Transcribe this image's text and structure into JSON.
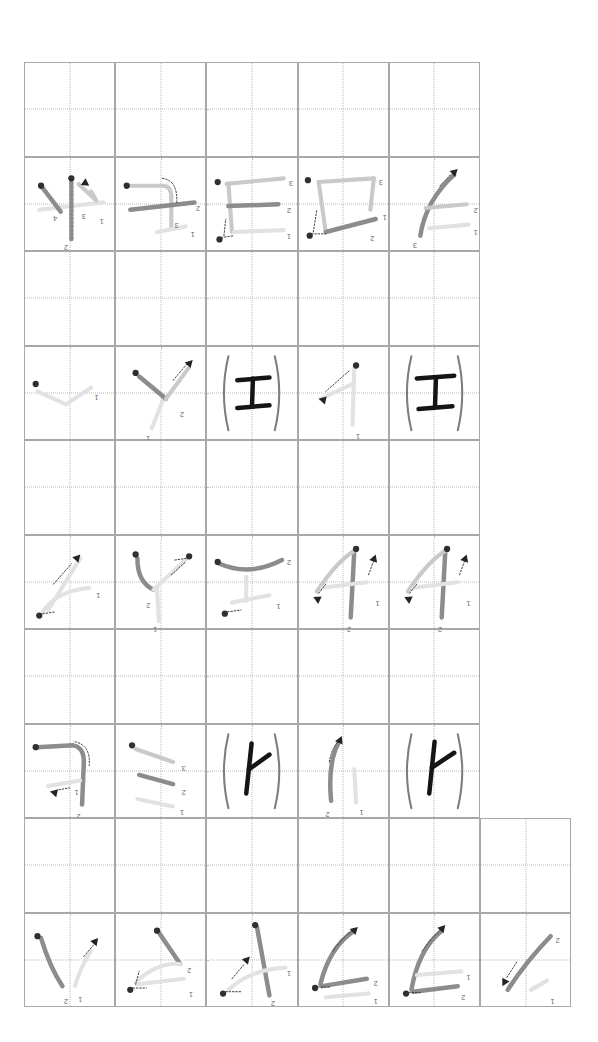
{
  "sheet": {
    "title": "Chinese character stroke-order practice grid",
    "orientation": "rotated-180",
    "page_width": 598,
    "page_height": 1042,
    "background_color": "#ffffff",
    "grid": {
      "origin_x": 24,
      "origin_y": 62,
      "cell_w": 91.2,
      "cell_h": 94.5,
      "main_columns": 5,
      "rows": 10,
      "extra_column_rows": [
        8,
        9
      ],
      "border_color": "#a8a8a8",
      "guide_color": "#b9b9b9",
      "guide_style": "dotted-cross"
    },
    "colors": {
      "stroke_active": "#8c8c8c",
      "stroke_done": "#c9c9c9",
      "stroke_faint": "#e2e2e2",
      "stroke_final": "#151515",
      "bracket": "#7d7d7d",
      "marker_dot": "#303030",
      "arrow": "#242424",
      "label_text": "#6a6a6a"
    },
    "stroke_numbers": [
      "1",
      "2",
      "3",
      "4"
    ],
    "row_kinds": [
      "blank",
      "strokes",
      "blank",
      "strokes",
      "blank",
      "strokes",
      "blank",
      "strokes",
      "blank",
      "strokes"
    ],
    "characters": [
      {
        "row": 1,
        "name": "char-row-1",
        "glyph": "",
        "strokes": 4
      },
      {
        "row": 3,
        "name": "char-row-3",
        "glyph": "工",
        "strokes": 3
      },
      {
        "row": 5,
        "name": "char-row-5",
        "glyph": "千",
        "strokes": 3
      },
      {
        "row": 7,
        "name": "char-row-7",
        "glyph": "人",
        "strokes": 2
      },
      {
        "row": 9,
        "name": "char-row-9",
        "glyph": "",
        "strokes": 2
      }
    ],
    "rows": [
      {
        "index": 0,
        "kind": "blank",
        "cells": 5,
        "cell_labels": []
      },
      {
        "index": 1,
        "kind": "strokes",
        "cells": 5,
        "cell_labels": [
          [
            "1",
            "2",
            "3",
            "4"
          ],
          [
            "1",
            "2",
            "3"
          ],
          [
            "1",
            "2",
            "3"
          ],
          [
            "1",
            "2",
            "3"
          ],
          [
            "1",
            "2",
            "3"
          ]
        ]
      },
      {
        "index": 2,
        "kind": "blank",
        "cells": 5,
        "cell_labels": []
      },
      {
        "index": 3,
        "kind": "strokes",
        "cells": 5,
        "cell_labels": [
          [
            "1"
          ],
          [
            "1",
            "2"
          ],
          [],
          [
            "1"
          ],
          []
        ]
      },
      {
        "index": 4,
        "kind": "blank",
        "cells": 5,
        "cell_labels": []
      },
      {
        "index": 5,
        "kind": "strokes",
        "cells": 5,
        "cell_labels": [
          [
            "1"
          ],
          [
            "1",
            "2"
          ],
          [
            "1",
            "2"
          ],
          [
            "1",
            "2"
          ],
          []
        ]
      },
      {
        "index": 6,
        "kind": "blank",
        "cells": 5,
        "cell_labels": []
      },
      {
        "index": 7,
        "kind": "strokes",
        "cells": 5,
        "cell_labels": [
          [
            "1",
            "2"
          ],
          [
            "1",
            "2",
            "3"
          ],
          [],
          [
            "1",
            "2"
          ],
          []
        ]
      },
      {
        "index": 8,
        "kind": "blank",
        "cells": 6,
        "cell_labels": []
      },
      {
        "index": 9,
        "kind": "strokes",
        "cells": 6,
        "cell_labels": [
          [
            "1",
            "2"
          ],
          [
            "1",
            "2"
          ],
          [
            "1",
            "2"
          ],
          [
            "1",
            "2"
          ],
          [
            "1",
            "2"
          ],
          [
            "1",
            "2"
          ]
        ]
      }
    ]
  }
}
